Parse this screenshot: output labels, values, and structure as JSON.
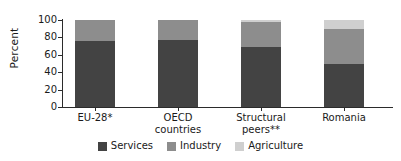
{
  "chart_data": {
    "type": "bar",
    "subtype": "stacked-bar-100",
    "title": "",
    "xlabel": "",
    "ylabel": "Percent",
    "ylim": [
      0,
      100
    ],
    "yticks": [
      0,
      20,
      40,
      60,
      80,
      100
    ],
    "grid": false,
    "legend_position": "bottom",
    "categories": [
      "EU-28*",
      "OECD countries",
      "Structural peers**",
      "Romania"
    ],
    "category_lines": [
      [
        "EU-28*"
      ],
      [
        "OECD",
        "countries"
      ],
      [
        "Structural",
        "peers**"
      ],
      [
        "Romania"
      ]
    ],
    "series": [
      {
        "name": "Services",
        "color": "#434343",
        "values": [
          76,
          77,
          69,
          49
        ]
      },
      {
        "name": "Industry",
        "color": "#8d8d8d",
        "values": [
          24,
          23,
          29,
          41
        ]
      },
      {
        "name": "Agriculture",
        "color": "#cfcfcf",
        "values": [
          0,
          0,
          2,
          10
        ]
      }
    ]
  },
  "axis": {
    "y_title": "Percent",
    "tick_labels": [
      "100",
      "80",
      "60",
      "40",
      "20",
      "0"
    ]
  },
  "legend": {
    "items": [
      {
        "label": "Services",
        "color": "#434343"
      },
      {
        "label": "Industry",
        "color": "#8d8d8d"
      },
      {
        "label": "Agriculture",
        "color": "#cfcfcf"
      }
    ]
  }
}
